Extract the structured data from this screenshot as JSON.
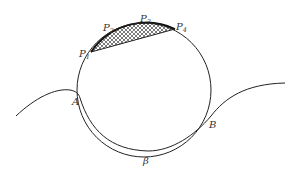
{
  "diagram": {
    "type": "geometric-figure",
    "colors": {
      "stroke": "#222222",
      "hatch": "#222222",
      "label": "#333333",
      "background": "#ffffff"
    },
    "labels": {
      "P1": {
        "base": "P",
        "sub": "1"
      },
      "P2": {
        "base": "P",
        "sub": "2"
      },
      "P3": {
        "base": "P",
        "sub": "3"
      },
      "P4": {
        "base": "P",
        "sub": "4"
      },
      "A": "A",
      "B": "B",
      "beta": "β"
    }
  }
}
